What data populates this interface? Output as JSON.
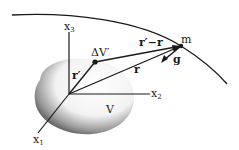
{
  "diagram": {
    "labels": {
      "x1": "x",
      "x1_sub": "1",
      "x2": "x",
      "x2_sub": "2",
      "x3": "x",
      "x3_sub": "3",
      "delta_v": "ΔV′",
      "r_prime": "r′",
      "r": "r",
      "r_prime_minus_r": "r′−r",
      "m": "m",
      "g": "g",
      "volume": "V"
    },
    "colors": {
      "ink": "#1a1a1a",
      "body_shade": "#6b6b6b",
      "background": "#ffffff"
    }
  }
}
